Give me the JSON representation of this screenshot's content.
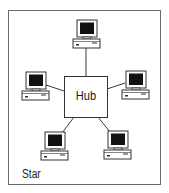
{
  "diagram": {
    "title": "Star",
    "topology": "star",
    "hub": {
      "label": "Hub"
    },
    "nodes": [
      {
        "id": "computer-top",
        "type": "computer"
      },
      {
        "id": "computer-left",
        "type": "computer"
      },
      {
        "id": "computer-right",
        "type": "computer"
      },
      {
        "id": "computer-bottom-left",
        "type": "computer"
      },
      {
        "id": "computer-bottom-right",
        "type": "computer"
      }
    ],
    "edges": [
      {
        "from": "hub",
        "to": "computer-top"
      },
      {
        "from": "hub",
        "to": "computer-left"
      },
      {
        "from": "hub",
        "to": "computer-right"
      },
      {
        "from": "hub",
        "to": "computer-bottom-left"
      },
      {
        "from": "hub",
        "to": "computer-bottom-right"
      }
    ],
    "colors": {
      "line": "#3a3a3a",
      "screen": "#111111",
      "frame": "#6a6a6a",
      "background": "#ffffff"
    }
  }
}
